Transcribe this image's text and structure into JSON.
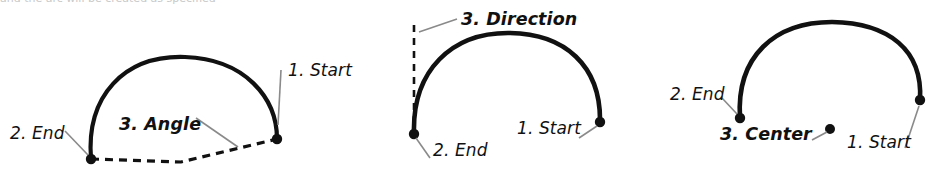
{
  "page": {
    "width": 935,
    "height": 175,
    "background": "#ffffff",
    "ink_color": "#111111",
    "leader_color": "#8a8a8a",
    "cut_off_top_text": "and the arc will be created as specified"
  },
  "figures": [
    {
      "id": "arc-by-angle",
      "name": "arc-three-point-angle",
      "labels": [
        {
          "id": "start",
          "text": "1. Start",
          "bold": false,
          "x": 288,
          "y": 62
        },
        {
          "id": "end",
          "text": "2. End",
          "bold": false,
          "x": 10,
          "y": 125
        },
        {
          "id": "angle",
          "text": "3. Angle",
          "bold": true,
          "x": 119,
          "y": 116
        }
      ],
      "points": [
        {
          "id": "start-point",
          "x": 277,
          "y": 139
        },
        {
          "id": "end-point",
          "x": 91,
          "y": 159
        }
      ]
    },
    {
      "id": "arc-by-direction",
      "name": "arc-three-point-direction",
      "labels": [
        {
          "id": "direction",
          "text": "3. Direction",
          "bold": true,
          "x": 461,
          "y": 11
        },
        {
          "id": "start",
          "text": "1. Start",
          "bold": false,
          "x": 517,
          "y": 120
        },
        {
          "id": "end",
          "text": "2. End",
          "bold": false,
          "x": 433,
          "y": 142
        }
      ],
      "points": [
        {
          "id": "start-point",
          "x": 600,
          "y": 122
        },
        {
          "id": "end-point",
          "x": 414,
          "y": 134
        }
      ]
    },
    {
      "id": "arc-by-center",
      "name": "arc-three-point-center",
      "labels": [
        {
          "id": "end",
          "text": "2. End",
          "bold": false,
          "x": 670,
          "y": 86
        },
        {
          "id": "center",
          "text": "3. Center",
          "bold": true,
          "x": 720,
          "y": 126
        },
        {
          "id": "start",
          "text": "1. Start",
          "bold": false,
          "x": 847,
          "y": 134
        }
      ],
      "points": [
        {
          "id": "start-point",
          "x": 920,
          "y": 100
        },
        {
          "id": "end-point",
          "x": 740,
          "y": 118
        },
        {
          "id": "center-point",
          "x": 830,
          "y": 129
        }
      ]
    }
  ]
}
